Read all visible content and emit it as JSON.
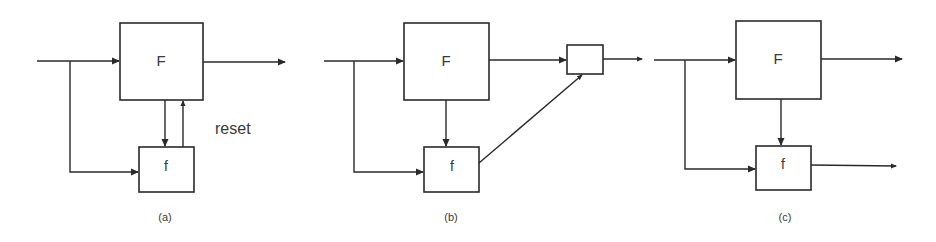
{
  "diagram": {
    "panels": [
      {
        "id": "a",
        "caption": "(a)",
        "main_block_label": "F",
        "sub_block_label": "f",
        "feedback_label": "reset"
      },
      {
        "id": "b",
        "caption": "(b)",
        "main_block_label": "F",
        "sub_block_label": "f",
        "combiner_block_label": ""
      },
      {
        "id": "c",
        "caption": "(c)",
        "main_block_label": "F",
        "sub_block_label": "f"
      }
    ],
    "colors": {
      "stroke": "#2a2a2a",
      "text": "#3a3a3a",
      "background": "#ffffff"
    }
  }
}
